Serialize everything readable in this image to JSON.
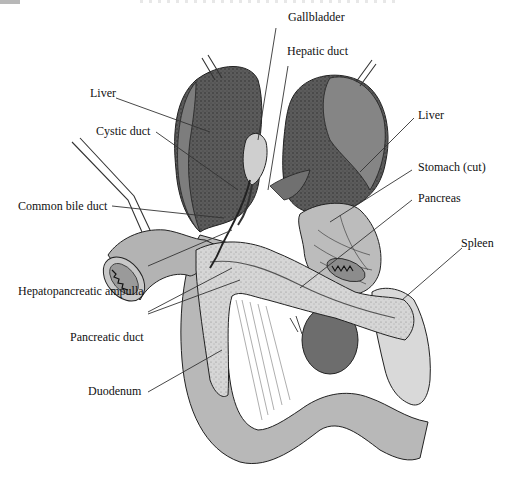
{
  "figure": {
    "title_cropped": ""
  },
  "colors": {
    "liver_dark": "#5a5a5a",
    "liver_mid": "#7a7a7a",
    "organ_light": "#bdbdbd",
    "pancreas": "#d4d4d4",
    "spleen": "#d9d9d9",
    "kidney": "#6e6e6e",
    "duodenum": "#b5b5b5",
    "gallbladder": "#cfcfcf",
    "outline": "#222222",
    "leader_line": "#333333"
  },
  "labels": {
    "gallbladder": "Gallbladder",
    "hepatic_duct": "Hepatic duct",
    "liver_left": "Liver",
    "liver_right": "Liver",
    "cystic_duct": "Cystic duct",
    "stomach": "Stomach (cut)",
    "pancreas": "Pancreas",
    "common_bile_duct": "Common bile duct",
    "spleen": "Spleen",
    "hepatopancreatic_ampulla": "Hepatopancreatic ampulla",
    "pancreatic_duct": "Pancreatic duct",
    "duodenum": "Duodenum"
  }
}
